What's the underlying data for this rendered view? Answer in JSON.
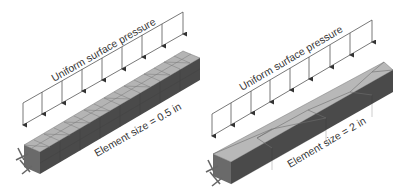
{
  "figure": {
    "panels": [
      {
        "load_label": "Uniform surface pressure",
        "mesh_label": "Element size = 0.5 in",
        "element_size_in": 0.5,
        "mesh": "fine"
      },
      {
        "load_label": "Uniform surface pressure",
        "mesh_label": "Element size = 2 in",
        "element_size_in": 2,
        "mesh": "coarse"
      }
    ],
    "colors": {
      "top_face": "#b4b4b4",
      "side_face": "#4a4a4a",
      "end_face": "#6a6a6a",
      "mesh_lines": "#6f6f6f",
      "load_lines": "#555555"
    }
  }
}
